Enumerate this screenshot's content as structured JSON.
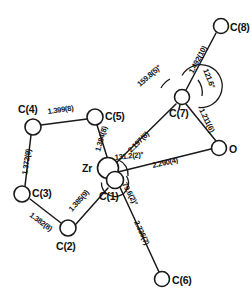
{
  "figure": {
    "kind": "molecular-structure-diagram",
    "background_color": "#ffffff",
    "line_color": "#1a1a1a"
  },
  "atoms": [
    {
      "id": "Zr",
      "label": "Zr",
      "x": 108,
      "y": 168,
      "r": 10.5,
      "label_x": 82,
      "label_y": 163,
      "anchor": "start"
    },
    {
      "id": "C1",
      "label": "C(1)",
      "x": 115,
      "y": 180,
      "r": 8.5,
      "label_x": 100,
      "label_y": 198,
      "anchor": "start"
    },
    {
      "id": "C2",
      "label": "C(2)",
      "x": 68,
      "y": 228,
      "r": 8.0,
      "label_x": 58,
      "label_y": 249,
      "anchor": "start"
    },
    {
      "id": "C3",
      "label": "C(3)",
      "x": 22,
      "y": 194,
      "r": 8.0,
      "label_x": 32,
      "label_y": 195,
      "anchor": "start"
    },
    {
      "id": "C4",
      "label": "C(4)",
      "x": 33,
      "y": 127,
      "r": 8.0,
      "label_x": 21,
      "label_y": 116,
      "anchor": "start"
    },
    {
      "id": "C5",
      "label": "C(5)",
      "x": 95,
      "y": 117,
      "r": 8.0,
      "label_x": 106,
      "label_y": 119,
      "anchor": "start"
    },
    {
      "id": "C6",
      "label": "C(6)",
      "x": 162,
      "y": 279,
      "r": 7.5,
      "label_x": 172,
      "label_y": 283,
      "anchor": "start"
    },
    {
      "id": "C7",
      "label": "C(7)",
      "x": 182,
      "y": 97,
      "r": 7.5,
      "label_x": 170,
      "label_y": 114,
      "anchor": "start"
    },
    {
      "id": "C8",
      "label": "C(8)",
      "x": 221,
      "y": 26,
      "r": 7.5,
      "label_x": 231,
      "label_y": 30,
      "anchor": "start"
    },
    {
      "id": "O",
      "label": "O",
      "x": 219,
      "y": 148,
      "r": 7.5,
      "label_x": 230,
      "label_y": 152,
      "anchor": "start"
    }
  ],
  "bonds": [
    {
      "from": "Zr",
      "to": "C5",
      "length_label": "1.384(8)",
      "label_x": 101,
      "label_y": 142,
      "rotation": -68
    },
    {
      "from": "Zr",
      "to": "C1",
      "length_label": "",
      "label_x": 0,
      "label_y": 0,
      "rotation": 0
    },
    {
      "from": "C1",
      "to": "C2",
      "length_label": "1.385(9)",
      "label_x": 72,
      "label_y": 201,
      "rotation": 44
    },
    {
      "from": "C2",
      "to": "C3",
      "length_label": "1.382(8)",
      "label_x": 30,
      "label_y": 219,
      "rotation": -34
    },
    {
      "from": "C3",
      "to": "C4",
      "length_label": "1.372(9)",
      "label_x": 30,
      "label_y": 156,
      "rotation": -80
    },
    {
      "from": "C4",
      "to": "C5",
      "length_label": "1.399(8)",
      "label_x": 47,
      "label_y": 115,
      "rotation": -8
    },
    {
      "from": "Zr",
      "to": "C7",
      "length_label": "2.197(6)",
      "label_x": 137,
      "label_y": 140,
      "rotation": -40
    },
    {
      "from": "Zr",
      "to": "O",
      "length_label": "2.290(4)",
      "label_x": 157,
      "label_y": 164,
      "rotation": -11
    },
    {
      "from": "Zr",
      "to": "C6",
      "length_label": "2.336(7)",
      "label_x": 137,
      "label_y": 229,
      "rotation": 63
    },
    {
      "from": "C7",
      "to": "C8",
      "length_label": "1.492(10)",
      "label_x": 196,
      "label_y": 67,
      "rotation": -62
    },
    {
      "from": "C7",
      "to": "O",
      "length_label": "1.211(6)",
      "label_x": 200,
      "label_y": 117,
      "rotation": 66
    }
  ],
  "angles": [
    {
      "id": "angle-c8-c7-zr",
      "value": "159.8(5)°",
      "label_x": 145,
      "label_y": 79,
      "rotation": -42,
      "center": "C7"
    },
    {
      "id": "angle-c8-c7-o",
      "value": "121.6°",
      "label_x": 205,
      "label_y": 75,
      "rotation": 66,
      "center": "C7"
    },
    {
      "id": "angle-c7-zr-o",
      "value": "131.2(2)°",
      "label_x": 117,
      "label_y": 157,
      "rotation": -5,
      "center": "Zr"
    },
    {
      "id": "angle-c1-zr-c6",
      "value": "79.6(2)°",
      "label_x": 121,
      "label_y": 183,
      "rotation": 63,
      "center": "Zr"
    }
  ],
  "arcs": [
    {
      "id": "arc-around-c7",
      "cx": 182,
      "cy": 97,
      "r": 20.5,
      "start_deg": 125,
      "end_deg": 60,
      "sweep": 1
    },
    {
      "id": "arc-zr-large",
      "cx": 112,
      "cy": 174,
      "r": 13.5,
      "start_deg": 250,
      "end_deg": 70,
      "sweep": 1
    }
  ]
}
